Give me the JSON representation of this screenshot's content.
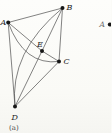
{
  "figure": {
    "caption": "(a)",
    "graph": {
      "description": "Complete graph K5 drawn with two crossings",
      "vertices": [
        {
          "id": "A",
          "x": 8.2,
          "y": 22.5,
          "label": "A",
          "label_x": 0.5,
          "label_y": 25
        },
        {
          "id": "B",
          "x": 62.5,
          "y": 8,
          "label": "B",
          "label_x": 66.5,
          "label_y": 10
        },
        {
          "id": "C",
          "x": 59,
          "y": 61.5,
          "label": "C",
          "label_x": 63.5,
          "label_y": 64
        },
        {
          "id": "D",
          "x": 15,
          "y": 106.5,
          "label": "D",
          "label_x": 11.5,
          "label_y": 119.5
        },
        {
          "id": "E",
          "x": 42,
          "y": 51,
          "label": "E",
          "label_x": 37,
          "label_y": 46.5
        }
      ],
      "edges": [
        {
          "from": "A",
          "to": "B"
        },
        {
          "from": "A",
          "to": "C",
          "curve": [
            24,
            66
          ]
        },
        {
          "from": "A",
          "to": "D"
        },
        {
          "from": "A",
          "to": "E"
        },
        {
          "from": "B",
          "to": "C"
        },
        {
          "from": "B",
          "to": "D",
          "curve": [
            9,
            52
          ]
        },
        {
          "from": "B",
          "to": "E"
        },
        {
          "from": "C",
          "to": "D"
        },
        {
          "from": "C",
          "to": "E"
        },
        {
          "from": "D",
          "to": "E"
        }
      ]
    },
    "colors": {
      "edge": "#4d4d4d",
      "vertex_dot": "#161616",
      "vertex_label": "#1f1f1f",
      "caption": "#4a4a4a",
      "fragment_label": "#6e6e6e",
      "background": "#fbfbf8"
    },
    "caption_x": 9,
    "caption_y": 130
  },
  "adjacent_figure_fragment": {
    "vertex_label": "A",
    "label_x": 99.5,
    "label_y": 27,
    "dot_x": 109.8,
    "dot_y": 24.5
  }
}
